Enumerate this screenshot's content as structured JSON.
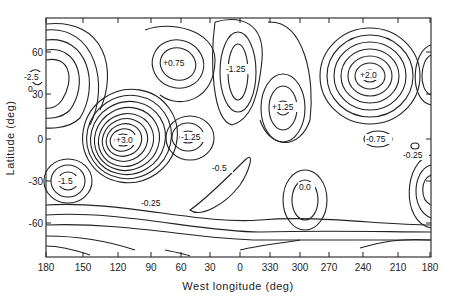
{
  "chart_data": {
    "type": "contour",
    "title": "",
    "xlabel": "West longitude (deg)",
    "ylabel": "Latitude (deg)",
    "x_ticks": [
      "180",
      "150",
      "120",
      "90",
      "60",
      "30",
      "0",
      "330",
      "300",
      "270",
      "240",
      "210",
      "180"
    ],
    "y_ticks": [
      "60",
      "30",
      "0",
      "-30",
      "-60"
    ],
    "xlim": [
      180,
      180
    ],
    "x_direction": "west longitude decreasing left-to-right, wrapping through 0 to 180",
    "ylim": [
      -85,
      85
    ],
    "grid": false,
    "legend": null,
    "contour_interval": 0.25,
    "extrema": [
      {
        "label": "-2.5",
        "lon": 165,
        "lat": 37,
        "kind": "minimum"
      },
      {
        "label": "+0.75",
        "lon": 55,
        "lat": 54,
        "kind": "maximum"
      },
      {
        "label": "-1.25",
        "lon": 0,
        "lat": 50,
        "kind": "minimum"
      },
      {
        "label": "+1.25",
        "lon": 320,
        "lat": 23,
        "kind": "maximum"
      },
      {
        "label": "+2.0",
        "lon": 235,
        "lat": 45,
        "kind": "maximum"
      },
      {
        "label": "+3.0",
        "lon": 115,
        "lat": 0,
        "kind": "maximum"
      },
      {
        "label": "-1.25",
        "lon": 60,
        "lat": 1,
        "kind": "minimum"
      },
      {
        "label": "-0.75",
        "lon": 225,
        "lat": 0,
        "kind": "minimum"
      },
      {
        "label": "-0.25",
        "lon": 195,
        "lat": -10,
        "kind": "minimum"
      },
      {
        "label": "-1.5",
        "lon": 162,
        "lat": -30,
        "kind": "minimum"
      },
      {
        "label": "-0.5",
        "lon": 20,
        "lat": -20,
        "kind": "contour"
      },
      {
        "label": "-0.25",
        "lon": 92,
        "lat": -45,
        "kind": "contour"
      },
      {
        "label": "0.0",
        "lon": 300,
        "lat": -34,
        "kind": "contour"
      }
    ]
  },
  "axes": {
    "xlabel": "West longitude (deg)",
    "ylabel": "Latitude (deg)",
    "x_ticks": [
      {
        "label": "180",
        "x": 46
      },
      {
        "label": "150",
        "x": 83
      },
      {
        "label": "120",
        "x": 118
      },
      {
        "label": "90",
        "x": 151
      },
      {
        "label": "60",
        "x": 181
      },
      {
        "label": "30",
        "x": 210
      },
      {
        "label": "0",
        "x": 240
      },
      {
        "label": "330",
        "x": 270
      },
      {
        "label": "300",
        "x": 300
      },
      {
        "label": "270",
        "x": 329
      },
      {
        "label": "240",
        "x": 363
      },
      {
        "label": "210",
        "x": 398
      },
      {
        "label": "180",
        "x": 430
      }
    ],
    "y_ticks": [
      {
        "label": "60",
        "y": 52
      },
      {
        "label": "30",
        "y": 94
      },
      {
        "label": "0",
        "y": 139
      },
      {
        "label": "-30",
        "y": 181
      },
      {
        "label": "-60",
        "y": 223
      }
    ]
  },
  "labels": [
    {
      "text": "-2.5",
      "x": 24,
      "y": 80
    },
    {
      "text": "0",
      "x": 28,
      "y": 92
    },
    {
      "text": "+0.75",
      "x": 163,
      "y": 66
    },
    {
      "text": "-1.25",
      "x": 226,
      "y": 72
    },
    {
      "text": "+1.25",
      "x": 272,
      "y": 110
    },
    {
      "text": "+2.0",
      "x": 360,
      "y": 78
    },
    {
      "text": "+3.0",
      "x": 116,
      "y": 143
    },
    {
      "text": "-1.25",
      "x": 181,
      "y": 140
    },
    {
      "text": "-0.75",
      "x": 366,
      "y": 142
    },
    {
      "text": "-0.25",
      "x": 403,
      "y": 158
    },
    {
      "text": "-1.5",
      "x": 58,
      "y": 184
    },
    {
      "text": "-0.5",
      "x": 212,
      "y": 171
    },
    {
      "text": "-0.25",
      "x": 141,
      "y": 206
    },
    {
      "text": "0.0",
      "x": 299,
      "y": 190
    }
  ]
}
